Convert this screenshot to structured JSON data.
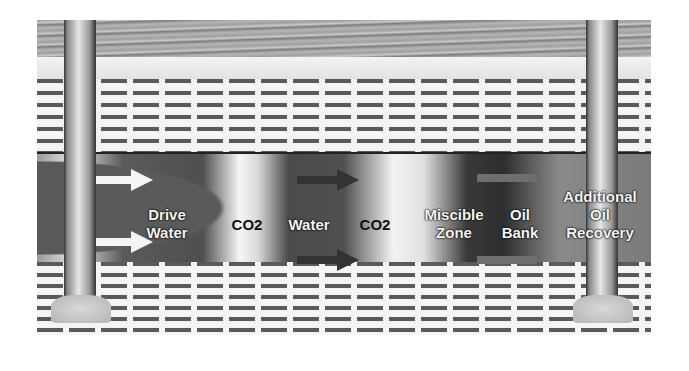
{
  "diagram": {
    "layers": [
      "overburden",
      "caprock",
      "reservoir",
      "basement"
    ],
    "wells": [
      {
        "name": "injection-well",
        "position": "left"
      },
      {
        "name": "production-well",
        "position": "right"
      }
    ],
    "zones": [
      {
        "id": "drive-water",
        "label": "Drive Water",
        "line1": "Drive",
        "line2": "Water",
        "style": "light"
      },
      {
        "id": "co2-1",
        "label": "CO2",
        "style": "dark"
      },
      {
        "id": "water",
        "label": "Water",
        "style": "light"
      },
      {
        "id": "co2-2",
        "label": "CO2",
        "style": "dark"
      },
      {
        "id": "miscible-zone",
        "label": "Miscible Zone",
        "line1": "Miscible",
        "line2": "Zone",
        "style": "light"
      },
      {
        "id": "oil-bank",
        "label": "Oil Bank",
        "line1": "Oil",
        "line2": "Bank",
        "style": "light"
      },
      {
        "id": "additional-oil-recovery",
        "label": "Additional Oil Recovery",
        "line1": "Additional",
        "line2": "Oil",
        "line3": "Recovery",
        "style": "light"
      }
    ],
    "flow_direction": "left-to-right",
    "colors": {
      "overburden": "#a3a3a3",
      "reservoir_dark": "#4f4f4f",
      "front_light": "#f2f2f2",
      "text_light": "#f5f5f5",
      "text_dark": "#111111"
    }
  }
}
